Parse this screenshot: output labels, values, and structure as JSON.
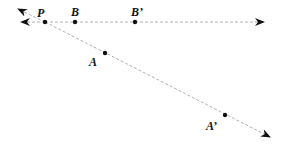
{
  "diagram": {
    "stroke_color": "#b0b0b0",
    "point_color": "#111111",
    "points": [
      {
        "id": "P",
        "label": "P",
        "x": 45,
        "y": 22,
        "lx": 37,
        "ly": 17
      },
      {
        "id": "B",
        "label": "B",
        "x": 75,
        "y": 22,
        "lx": 71,
        "ly": 16
      },
      {
        "id": "B_prime",
        "label": "B’",
        "x": 135,
        "y": 22,
        "lx": 131,
        "ly": 16
      },
      {
        "id": "A",
        "label": "A",
        "x": 105,
        "y": 53,
        "lx": 89,
        "ly": 66
      },
      {
        "id": "A_prime",
        "label": "A’",
        "x": 225,
        "y": 115,
        "lx": 206,
        "ly": 130
      }
    ],
    "rays": [
      {
        "id": "ray-PB",
        "from": "P",
        "through": "B'",
        "direction": "horizontal"
      },
      {
        "id": "ray-PA",
        "from": "P",
        "through": "A'",
        "direction": "diagonal"
      }
    ]
  }
}
